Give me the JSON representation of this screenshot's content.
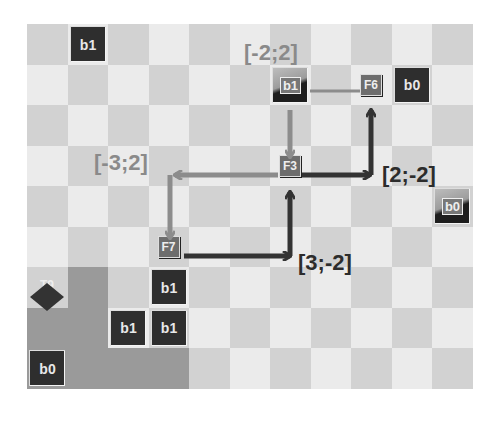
{
  "board": {
    "columns": 11,
    "rows": 9,
    "colors": {
      "light": "#ebebeb",
      "dark": "#d2d2d2",
      "zone": "#9a9a9a",
      "tile": "#2e2e2e",
      "arrow_dark": "#333333",
      "arrow_gray": "#8c8c8c"
    }
  },
  "tiles": [
    {
      "id": "tile-b1-top",
      "label": "b1",
      "col": 1,
      "row": 0,
      "style": "solid"
    },
    {
      "id": "tile-b1-framed",
      "label": "b1",
      "col": 6,
      "row": 1,
      "style": "framed"
    },
    {
      "id": "tile-b0-right",
      "label": "b0",
      "col": 9,
      "row": 1,
      "style": "solid"
    },
    {
      "id": "tile-b0-framed",
      "label": "b0",
      "col": 10,
      "row": 4,
      "style": "framed"
    },
    {
      "id": "tile-b1-a",
      "label": "b1",
      "col": 3,
      "row": 6,
      "style": "solid"
    },
    {
      "id": "tile-b1-b",
      "label": "b1",
      "col": 2,
      "row": 7,
      "style": "solid"
    },
    {
      "id": "tile-b1-c",
      "label": "b1",
      "col": 3,
      "row": 7,
      "style": "solid"
    },
    {
      "id": "tile-b0-bottom",
      "label": "b0",
      "col": 0,
      "row": 8,
      "style": "solid"
    }
  ],
  "nodes": [
    {
      "id": "F6",
      "label": "F6",
      "col": 8,
      "row": 1
    },
    {
      "id": "F3",
      "label": "F3",
      "col": 6,
      "row": 3
    },
    {
      "id": "F7",
      "label": "F7",
      "col": 3,
      "row": 5
    },
    {
      "id": "T9",
      "label": "T9",
      "col": 0,
      "row": 6
    }
  ],
  "labels": {
    "l_neg2_2": "[-2;2]",
    "l_neg3_2": "[-3;2]",
    "l_2_neg2": "[2;-2]",
    "l_3_neg2": "[3;-2]"
  }
}
